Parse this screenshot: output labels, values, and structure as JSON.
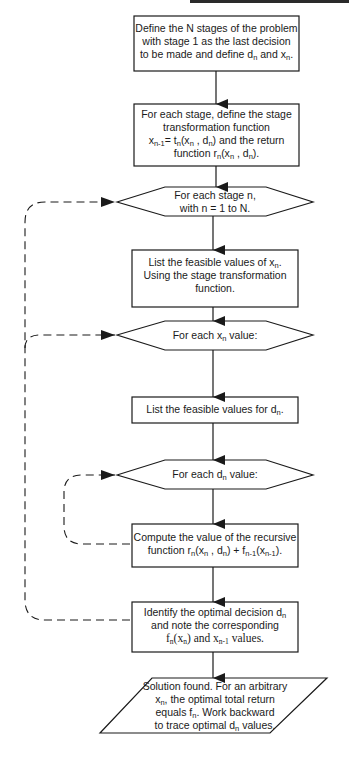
{
  "diagram": {
    "type": "flowchart",
    "title": "",
    "nodes": [
      {
        "id": "define_stages",
        "shape": "rectangle",
        "lines": [
          "Define the N stages of the problem",
          "with stage 1 as the last decision",
          "to be made and define d_n and x_n."
        ]
      },
      {
        "id": "define_functions",
        "shape": "rectangle",
        "lines": [
          "For each stage, define the stage",
          "transformation function",
          "x_{n-1} = t_n(x_n , d_n) and the return",
          "function r_n(x_n , d_n)."
        ]
      },
      {
        "id": "loop_stage",
        "shape": "hexagon",
        "lines": [
          "For each stage n,",
          "with n = 1 to N."
        ]
      },
      {
        "id": "list_x",
        "shape": "rectangle",
        "lines": [
          "List the feasible values of x_n.",
          "Using the stage transformation",
          "function."
        ]
      },
      {
        "id": "loop_x",
        "shape": "hexagon",
        "lines": [
          "For each x_n value:"
        ]
      },
      {
        "id": "list_d",
        "shape": "rectangle",
        "lines": [
          "List the feasible values for d_n."
        ]
      },
      {
        "id": "loop_d",
        "shape": "hexagon",
        "lines": [
          "For each d_n value:"
        ]
      },
      {
        "id": "compute",
        "shape": "rectangle",
        "lines": [
          "Compute the value of the recursive",
          "function r_n(x_n , d_n) + f_{n-1}(x_{n-1})."
        ]
      },
      {
        "id": "identify",
        "shape": "rectangle",
        "lines": [
          "Identify the optimal decision d_n",
          "and note the corresponding",
          "f_n(x_n) and x_{n-1} values."
        ]
      },
      {
        "id": "solution",
        "shape": "parallelogram",
        "lines": [
          "Solution found.  For an arbitrary",
          "x_n, the optimal total return",
          "equals f_n.  Work backward",
          "to trace optimal d_n values."
        ]
      }
    ],
    "edges": [
      {
        "from": "define_stages",
        "to": "define_functions",
        "style": "solid"
      },
      {
        "from": "define_functions",
        "to": "loop_stage",
        "style": "solid"
      },
      {
        "from": "loop_stage",
        "to": "list_x",
        "style": "solid"
      },
      {
        "from": "list_x",
        "to": "loop_x",
        "style": "solid"
      },
      {
        "from": "loop_x",
        "to": "list_d",
        "style": "solid"
      },
      {
        "from": "list_d",
        "to": "loop_d",
        "style": "solid"
      },
      {
        "from": "loop_d",
        "to": "compute",
        "style": "solid"
      },
      {
        "from": "compute",
        "to": "identify",
        "style": "solid"
      },
      {
        "from": "identify",
        "to": "solution",
        "style": "solid"
      },
      {
        "from": "compute",
        "to": "loop_d",
        "style": "dashed"
      },
      {
        "from": "identify",
        "to": "loop_x",
        "style": "dashed"
      },
      {
        "from": "identify",
        "to": "loop_stage",
        "style": "dashed"
      }
    ]
  },
  "text": {
    "n1": {
      "l1": "Define the N stages of the problem",
      "l2": "with stage 1 as the last decision",
      "l3a": "to be made and define d",
      "l3b": "n",
      "l3c": " and x",
      "l3d": "n",
      "l3e": "."
    },
    "n2": {
      "l1": "For each stage, define the stage",
      "l2": "transformation function",
      "l3a": "x",
      "l3b": "n-1",
      "l3c": "= t",
      "l3d": "n",
      "l3e": "(x",
      "l3f": "n",
      "l3g": " , d",
      "l3h": "n",
      "l3i": ") and the return",
      "l4a": "function r",
      "l4b": "n",
      "l4c": "(x",
      "l4d": "n",
      "l4e": " , d",
      "l4f": "n",
      "l4g": ")."
    },
    "n3": {
      "l1": "For each stage n,",
      "l2": "with n = 1 to N."
    },
    "n4": {
      "l1a": "List the feasible values of x",
      "l1b": "n",
      "l1c": ".",
      "l2": "Using the stage transformation",
      "l3": "function."
    },
    "n5": {
      "a": "For each x",
      "b": "n",
      "c": " value:"
    },
    "n6": {
      "a": "List the feasible values for d",
      "b": "n",
      "c": "."
    },
    "n7": {
      "a": "For each d",
      "b": "n",
      "c": "  value:"
    },
    "n8": {
      "l1": "Compute the value of the recursive",
      "l2a": "function r",
      "l2b": "n",
      "l2c": "(x",
      "l2d": "n",
      "l2e": " , d",
      "l2f": "n",
      "l2g": ") + f",
      "l2h": "n-1",
      "l2i": "(x",
      "l2j": "n-1",
      "l2k": ")."
    },
    "n9": {
      "l1a": "Identify the optimal decision d",
      "l1b": "n",
      "l2": "and note the corresponding",
      "l3a": "f",
      "l3b": "n",
      "l3c": "(x",
      "l3d": "n",
      "l3e": ")  and x",
      "l3f": "n-1",
      "l3g": " values."
    },
    "n10": {
      "l1": "Solution found.  For an arbitrary",
      "l2a": "x",
      "l2b": "n",
      "l2c": ", the optimal total return",
      "l3a": "equals f",
      "l3b": "n",
      "l3c": ".  Work backward",
      "l4a": "to trace optimal d",
      "l4b": "n",
      "l4c": "  values."
    }
  },
  "colors": {
    "stroke": "#1a1a1a",
    "background": "#ffffff",
    "topbar": "#2a2a2a"
  }
}
